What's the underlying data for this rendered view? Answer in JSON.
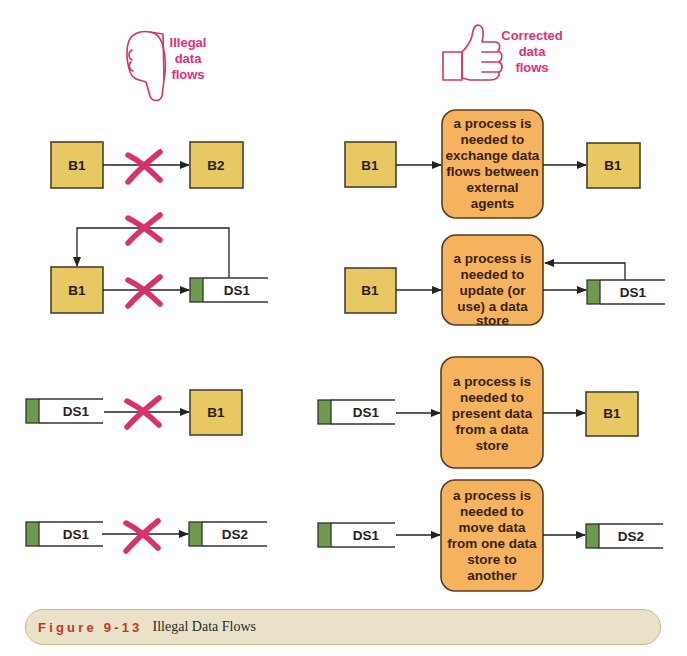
{
  "headings": {
    "illegal": {
      "icon": "thumbs-down-icon",
      "lines": [
        "Illegal",
        "data",
        "flows"
      ]
    },
    "corrected": {
      "icon": "thumbs-up-icon",
      "lines": [
        "Corrected",
        "data",
        "flows"
      ]
    }
  },
  "colors": {
    "heading_pink": "#e0307a",
    "cross_pink": "#d8326e",
    "external_agent_fill": "#e8c862",
    "process_fill": "#f5b25f",
    "datastore_tab": "#6f9a4e",
    "caption_bg": "#e9e1c8",
    "caption_label": "#c2361e"
  },
  "illegal": {
    "row1": {
      "source": "B1",
      "target": "B2",
      "marker": "x-mark"
    },
    "row2": {
      "source": "B1",
      "target": "DS1",
      "return_marker": "x-mark",
      "marker": "x-mark"
    },
    "row3": {
      "source": "DS1",
      "target": "B1",
      "marker": "x-mark"
    },
    "row4": {
      "source": "DS1",
      "target": "DS2",
      "marker": "x-mark"
    }
  },
  "corrected": {
    "row1": {
      "source": "B1",
      "target": "B1",
      "process": [
        "a process is",
        "needed to",
        "exchange data",
        "flows between",
        "external",
        "agents"
      ]
    },
    "row2": {
      "source": "B1",
      "target": "DS1",
      "process": [
        "a process is",
        "needed to",
        "update (or",
        "use) a data",
        "store"
      ]
    },
    "row3": {
      "source": "DS1",
      "target": "B1",
      "process": [
        "a process is",
        "needed to",
        "present data",
        "from a data",
        "store"
      ]
    },
    "row4": {
      "source": "DS1",
      "target": "DS2",
      "process": [
        "a process is",
        "needed to",
        "move data",
        "from one data",
        "store to",
        "another"
      ]
    }
  },
  "caption": {
    "figure_label": "Figure 9-13",
    "title": "Illegal Data Flows"
  }
}
